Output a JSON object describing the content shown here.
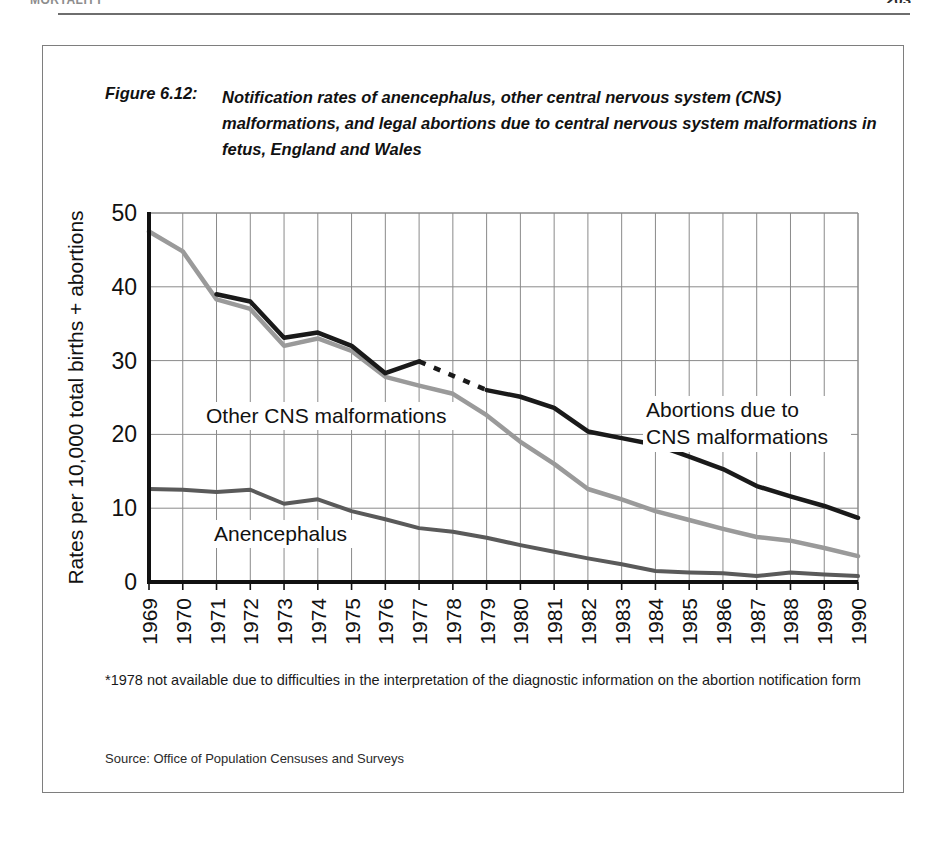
{
  "page": {
    "running_head": "MORTALITY",
    "page_number": "203"
  },
  "figure": {
    "label": "Figure 6.12:",
    "title": "Notification rates of anencephalus, other central nervous system (CNS) malformations, and legal abortions due to central nervous system malformations in fetus, England and Wales",
    "footnote": "*1978 not available due to difficulties in the interpretation of the diagnostic information on the abortion notification form",
    "source": "Source: Office of Population Censuses and Surveys"
  },
  "annotations": {
    "other_cns": "Other CNS malformations",
    "anencephalus": "Anencephalus",
    "abortions_line1": "Abortions due to",
    "abortions_line2": "CNS malformations"
  },
  "colors": {
    "abortions": "#1a1a1a",
    "other_cns": "#9a9a9a",
    "anencephalus": "#5a5a5a",
    "grid": "#8a8a8a",
    "axis": "#111111",
    "frame": "#7e7e7e"
  },
  "chart_data": {
    "type": "line",
    "title": "Notification rates of anencephalus, other central nervous system (CNS) malformations, and legal abortions due to central nervous system malformations in fetus, England and Wales",
    "xlabel": "",
    "ylabel": "Rates per 10,000 total births + abortions",
    "xlim": [
      1969,
      1990
    ],
    "ylim": [
      0,
      50
    ],
    "yticks": [
      0,
      10,
      20,
      30,
      40,
      50
    ],
    "grid": true,
    "legend": "inline-annotations",
    "x": [
      1969,
      1970,
      1971,
      1972,
      1973,
      1974,
      1975,
      1976,
      1977,
      1978,
      1979,
      1980,
      1981,
      1982,
      1983,
      1984,
      1985,
      1986,
      1987,
      1988,
      1989,
      1990
    ],
    "series": [
      {
        "name": "Other CNS malformations",
        "color": "#9a9a9a",
        "style": "solid",
        "values": [
          47.5,
          44.8,
          38.3,
          37.0,
          32.0,
          33.0,
          31.3,
          27.8,
          26.6,
          25.5,
          22.6,
          19.0,
          16.0,
          12.6,
          11.2,
          9.6,
          8.4,
          7.2,
          6.1,
          5.6,
          4.6,
          3.5
        ]
      },
      {
        "name": "Abortions due to CNS malformations",
        "color": "#1a1a1a",
        "style": "solid-with-dashed-gap",
        "dashed_segment_years": [
          1977,
          1979
        ],
        "missing_year": 1978,
        "values": [
          null,
          null,
          39.0,
          38.0,
          33.1,
          33.8,
          32.0,
          28.3,
          29.9,
          null,
          26.0,
          25.1,
          23.6,
          20.4,
          19.5,
          18.6,
          17.0,
          15.3,
          13.0,
          11.6,
          10.3,
          8.7
        ]
      },
      {
        "name": "Anencephalus",
        "color": "#5a5a5a",
        "style": "solid",
        "values": [
          12.6,
          12.5,
          12.2,
          12.5,
          10.6,
          11.2,
          9.6,
          8.5,
          7.3,
          6.8,
          6.0,
          5.0,
          4.1,
          3.2,
          2.4,
          1.5,
          1.3,
          1.2,
          0.8,
          1.3,
          1.0,
          0.8
        ]
      }
    ]
  }
}
